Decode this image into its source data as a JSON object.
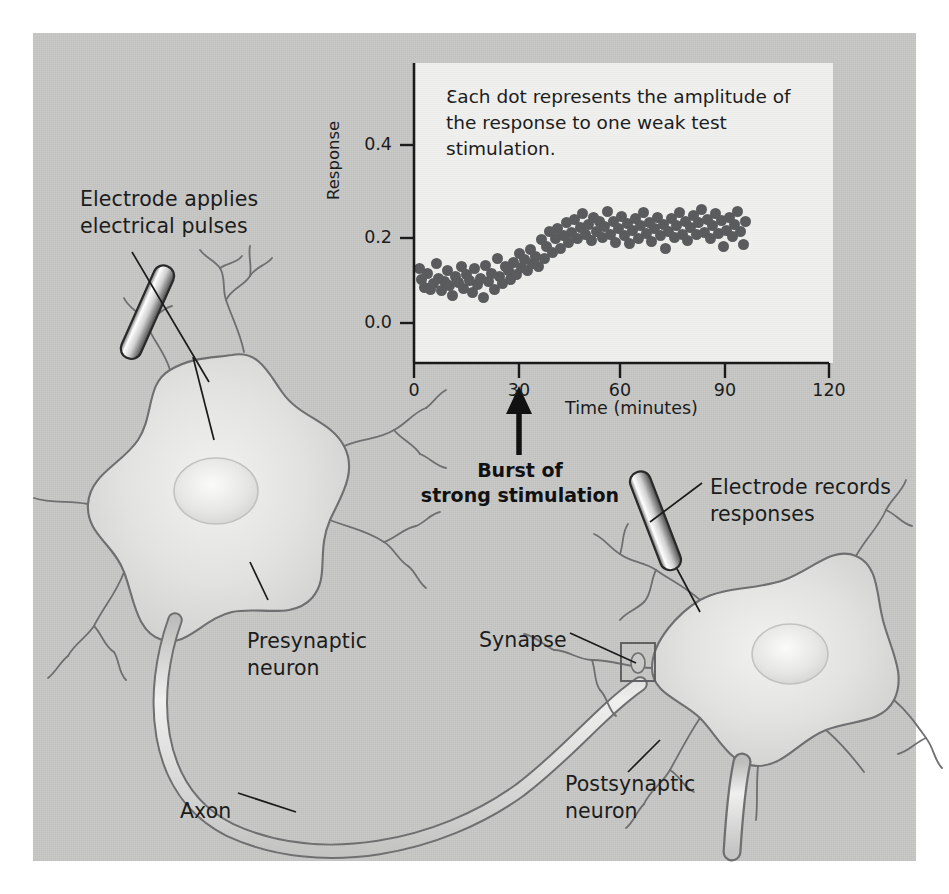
{
  "figure": {
    "background_color": "#c8c9c7",
    "panel_color": "#efefed",
    "dot_color": "#5a5b5d",
    "soma_fill": "#dedede",
    "outline_color": "#6e6f71"
  },
  "annotations": [
    {
      "name": "electrode-applies-label",
      "text": "Electrode applies\nelectrical pulses",
      "x": 80,
      "y": 186
    },
    {
      "name": "presynaptic-neuron-label",
      "text": "Presynaptic\nneuron",
      "x": 247,
      "y": 628
    },
    {
      "name": "axon-label",
      "text": "Axon",
      "x": 180,
      "y": 798
    },
    {
      "name": "electrode-records-label",
      "text": "Electrode records\nresponses",
      "x": 710,
      "y": 474
    },
    {
      "name": "synapse-label",
      "text": "Synapse",
      "x": 479,
      "y": 627
    },
    {
      "name": "postsynaptic-neuron-label",
      "text": "Postsynaptic\nneuron",
      "x": 565,
      "y": 771
    }
  ],
  "chart_data": {
    "type": "scatter",
    "title": "",
    "caption": "Ɛach dot represents the amplitude of the response to one weak test stimulation.",
    "xlabel": "Time (minutes)",
    "ylabel": "Response",
    "xlim": [
      0,
      120
    ],
    "ylim": [
      0.0,
      0.44
    ],
    "xticks": [
      0,
      30,
      60,
      90,
      120
    ],
    "xtick_labels": [
      "0",
      "30",
      "60",
      "90",
      "120"
    ],
    "yticks": [
      0.0,
      0.2,
      0.4
    ],
    "ytick_labels": [
      "0.0",
      "0.2",
      "0.4"
    ],
    "grid": false,
    "legend": null,
    "annotation": {
      "text": "Burst of\nstrong stimulation",
      "x": 30,
      "arrow": "up"
    },
    "series": [
      {
        "name": "Response amplitude",
        "color": "#5a5b5d",
        "points": [
          [
            1.5,
            0.123
          ],
          [
            2.2,
            0.098
          ],
          [
            3.0,
            0.079
          ],
          [
            4.0,
            0.112
          ],
          [
            4.8,
            0.075
          ],
          [
            5.6,
            0.088
          ],
          [
            6.4,
            0.133
          ],
          [
            7.2,
            0.101
          ],
          [
            8.0,
            0.072
          ],
          [
            8.8,
            0.093
          ],
          [
            9.6,
            0.118
          ],
          [
            10.4,
            0.084
          ],
          [
            11.2,
            0.062
          ],
          [
            12.0,
            0.105
          ],
          [
            12.8,
            0.09
          ],
          [
            13.6,
            0.126
          ],
          [
            14.4,
            0.078
          ],
          [
            15.2,
            0.108
          ],
          [
            16.0,
            0.095
          ],
          [
            16.8,
            0.068
          ],
          [
            17.6,
            0.122
          ],
          [
            18.4,
            0.086
          ],
          [
            19.2,
            0.1
          ],
          [
            20.0,
            0.058
          ],
          [
            20.8,
            0.13
          ],
          [
            21.6,
            0.093
          ],
          [
            22.4,
            0.112
          ],
          [
            23.2,
            0.076
          ],
          [
            24.0,
            0.145
          ],
          [
            24.8,
            0.104
          ],
          [
            25.6,
            0.088
          ],
          [
            26.4,
            0.128
          ],
          [
            27.2,
            0.118
          ],
          [
            28.0,
            0.097
          ],
          [
            28.8,
            0.136
          ],
          [
            29.6,
            0.11
          ],
          [
            30.4,
            0.156
          ],
          [
            31.2,
            0.124
          ],
          [
            32.0,
            0.142
          ],
          [
            32.8,
            0.118
          ],
          [
            33.6,
            0.165
          ],
          [
            34.4,
            0.133
          ],
          [
            35.2,
            0.15
          ],
          [
            36.0,
            0.128
          ],
          [
            36.8,
            0.188
          ],
          [
            37.6,
            0.145
          ],
          [
            38.4,
            0.172
          ],
          [
            39.2,
            0.205
          ],
          [
            40.0,
            0.158
          ],
          [
            40.8,
            0.19
          ],
          [
            41.6,
            0.212
          ],
          [
            42.4,
            0.168
          ],
          [
            43.2,
            0.196
          ],
          [
            44.0,
            0.225
          ],
          [
            44.8,
            0.18
          ],
          [
            45.6,
            0.204
          ],
          [
            46.4,
            0.232
          ],
          [
            47.2,
            0.19
          ],
          [
            48.0,
            0.215
          ],
          [
            48.8,
            0.245
          ],
          [
            49.6,
            0.198
          ],
          [
            50.4,
            0.222
          ],
          [
            51.2,
            0.186
          ],
          [
            52.0,
            0.238
          ],
          [
            52.8,
            0.205
          ],
          [
            53.6,
            0.228
          ],
          [
            54.4,
            0.192
          ],
          [
            55.2,
            0.216
          ],
          [
            56.0,
            0.25
          ],
          [
            56.8,
            0.2
          ],
          [
            57.6,
            0.228
          ],
          [
            58.4,
            0.182
          ],
          [
            59.2,
            0.212
          ],
          [
            60.0,
            0.24
          ],
          [
            60.8,
            0.196
          ],
          [
            61.6,
            0.224
          ],
          [
            62.4,
            0.178
          ],
          [
            63.2,
            0.208
          ],
          [
            64.0,
            0.235
          ],
          [
            64.8,
            0.19
          ],
          [
            65.6,
            0.218
          ],
          [
            66.4,
            0.248
          ],
          [
            67.2,
            0.202
          ],
          [
            68.0,
            0.226
          ],
          [
            68.8,
            0.184
          ],
          [
            69.6,
            0.212
          ],
          [
            70.4,
            0.238
          ],
          [
            71.2,
            0.196
          ],
          [
            72.0,
            0.222
          ],
          [
            72.8,
            0.168
          ],
          [
            73.6,
            0.206
          ],
          [
            74.4,
            0.234
          ],
          [
            75.2,
            0.192
          ],
          [
            76.0,
            0.22
          ],
          [
            76.8,
            0.248
          ],
          [
            77.6,
            0.2
          ],
          [
            78.4,
            0.228
          ],
          [
            79.2,
            0.186
          ],
          [
            80.0,
            0.214
          ],
          [
            80.8,
            0.242
          ],
          [
            81.6,
            0.198
          ],
          [
            82.4,
            0.226
          ],
          [
            83.2,
            0.254
          ],
          [
            84.0,
            0.204
          ],
          [
            84.8,
            0.232
          ],
          [
            85.6,
            0.19
          ],
          [
            86.4,
            0.218
          ],
          [
            87.2,
            0.246
          ],
          [
            88.0,
            0.202
          ],
          [
            88.8,
            0.23
          ],
          [
            89.6,
            0.172
          ],
          [
            90.4,
            0.208
          ],
          [
            91.2,
            0.236
          ],
          [
            92.0,
            0.194
          ],
          [
            92.8,
            0.222
          ],
          [
            93.6,
            0.25
          ],
          [
            94.4,
            0.206
          ],
          [
            95.2,
            0.176
          ],
          [
            95.8,
            0.228
          ]
        ]
      }
    ]
  }
}
